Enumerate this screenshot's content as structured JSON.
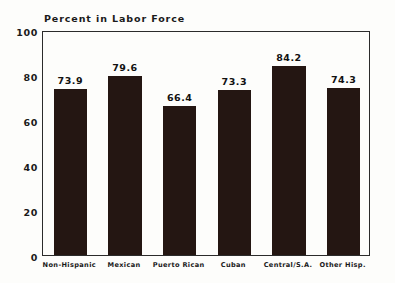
{
  "chart_data": {
    "type": "bar",
    "title": "Percent in Labor Force",
    "xlabel": "",
    "ylabel": "",
    "ylim": [
      0,
      100
    ],
    "yticks": [
      0,
      20,
      40,
      60,
      80,
      100
    ],
    "grid": false,
    "legend": null,
    "categories": [
      "Non-Hispanic",
      "Mexican",
      "Puerto Rican",
      "Cuban",
      "Central/S.A.",
      "Other Hisp."
    ],
    "values": [
      73.9,
      79.6,
      66.4,
      73.3,
      84.2,
      74.3
    ],
    "value_labels": [
      "73.9",
      "79.6",
      "66.4",
      "73.3",
      "84.2",
      "74.3"
    ],
    "bar_color": "#241612",
    "axis_color": "#2b2b2b",
    "background_color": "#fdfdfb"
  }
}
